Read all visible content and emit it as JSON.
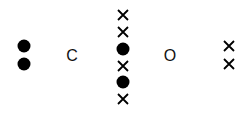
{
  "diagram": {
    "left_group": [
      {
        "type": "dot",
        "x": 24,
        "y": 46
      },
      {
        "type": "dot",
        "x": 24,
        "y": 64
      }
    ],
    "label_left": {
      "text": "C",
      "x": 72,
      "y": 56
    },
    "center_column": [
      {
        "type": "cross",
        "x": 123,
        "y": 15
      },
      {
        "type": "cross",
        "x": 123,
        "y": 32
      },
      {
        "type": "dot",
        "x": 123,
        "y": 49
      },
      {
        "type": "cross",
        "x": 123,
        "y": 66
      },
      {
        "type": "dot",
        "x": 123,
        "y": 82
      },
      {
        "type": "cross",
        "x": 123,
        "y": 99
      }
    ],
    "label_right": {
      "text": "O",
      "x": 170,
      "y": 56
    },
    "right_group": [
      {
        "type": "cross",
        "x": 229,
        "y": 46
      },
      {
        "type": "cross",
        "x": 229,
        "y": 64
      }
    ],
    "colors": {
      "mark": "#000000",
      "background": "#ffffff"
    }
  }
}
